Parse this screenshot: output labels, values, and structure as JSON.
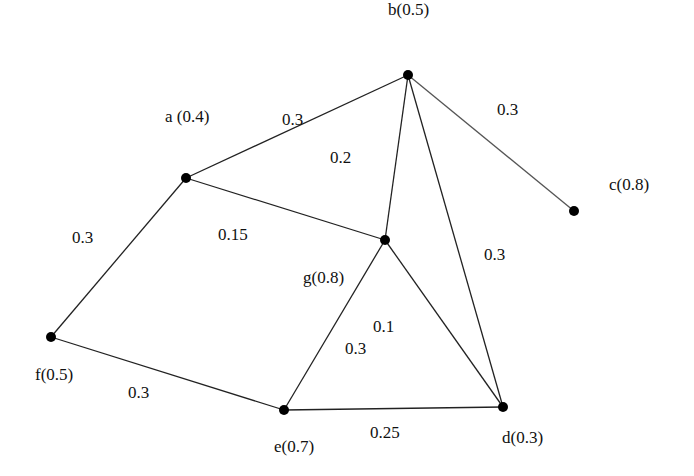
{
  "nodes": [
    {
      "id": "a",
      "label": "a (0.4)",
      "x": 186,
      "y": 178,
      "lx": 165,
      "ly": 122
    },
    {
      "id": "b",
      "label": "b(0.5)",
      "x": 408,
      "y": 75,
      "lx": 388,
      "ly": 15
    },
    {
      "id": "c",
      "label": "c(0.8)",
      "x": 574,
      "y": 211,
      "lx": 609,
      "ly": 190
    },
    {
      "id": "d",
      "label": "d(0.3)",
      "x": 503,
      "y": 407,
      "lx": 502,
      "ly": 443
    },
    {
      "id": "e",
      "label": "e(0.7)",
      "x": 284,
      "y": 410,
      "lx": 274,
      "ly": 452
    },
    {
      "id": "f",
      "label": "f(0.5)",
      "x": 51,
      "y": 337,
      "lx": 35,
      "ly": 380
    },
    {
      "id": "g",
      "label": "g(0.8)",
      "x": 385,
      "y": 240,
      "lx": 303,
      "ly": 283
    }
  ],
  "edges": [
    {
      "from": "a",
      "to": "b",
      "weight": "0.3",
      "lx": 282,
      "ly": 125
    },
    {
      "from": "b",
      "to": "c",
      "weight": "0.3",
      "lx": 497,
      "ly": 115,
      "light": true
    },
    {
      "from": "a",
      "to": "g",
      "weight": "0.15",
      "lx": 218,
      "ly": 240
    },
    {
      "from": "b",
      "to": "g",
      "weight": "0.2",
      "lx": 330,
      "ly": 163
    },
    {
      "from": "b",
      "to": "d",
      "weight": "0.3",
      "lx": 484,
      "ly": 260
    },
    {
      "from": "a",
      "to": "f",
      "weight": "0.3",
      "lx": 72,
      "ly": 243
    },
    {
      "from": "f",
      "to": "e",
      "weight": "0.3",
      "lx": 128,
      "ly": 398
    },
    {
      "from": "g",
      "to": "e",
      "weight": "0.3",
      "lx": 345,
      "ly": 354
    },
    {
      "from": "g",
      "to": "d",
      "weight": "0.1",
      "lx": 373,
      "ly": 332
    },
    {
      "from": "e",
      "to": "d",
      "weight": "0.25",
      "lx": 370,
      "ly": 438
    }
  ]
}
